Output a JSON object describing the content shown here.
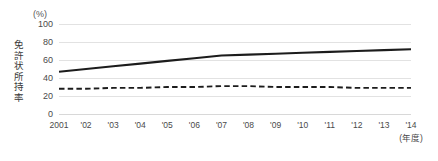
{
  "axis": {
    "unit_label": "(%)",
    "y_title": "免許状所持率",
    "y_title_chars": [
      "免",
      "許",
      "状",
      "所",
      "持",
      "率"
    ],
    "x_unit": "(年度)"
  },
  "chart_data": {
    "type": "line",
    "title": "",
    "xlabel": "(年度)",
    "ylabel": "免許状所持率",
    "yunit": "(%)",
    "ylim": [
      0,
      100
    ],
    "yticks": [
      0,
      20,
      40,
      60,
      80,
      100
    ],
    "ytick_labels": [
      "0",
      "20",
      "40",
      "60",
      "80",
      "100"
    ],
    "grid": true,
    "legend": "none",
    "categories": [
      2001,
      2002,
      2003,
      2004,
      2005,
      2006,
      2007,
      2008,
      2009,
      2010,
      2011,
      2012,
      2013,
      2014
    ],
    "xtick_labels": [
      "2001",
      "'02",
      "'03",
      "'04",
      "'05",
      "'06",
      "'07",
      "'08",
      "'09",
      "'10",
      "'11",
      "'12",
      "'13",
      "'14"
    ],
    "series": [
      {
        "name": "solid-series",
        "style": "solid",
        "color": "#1c1c1c",
        "values": [
          47,
          50,
          53,
          56,
          59,
          62,
          65,
          66,
          67,
          68,
          69,
          70,
          71,
          72
        ]
      },
      {
        "name": "dashed-series",
        "style": "dashed",
        "color": "#1c1c1c",
        "values": [
          28,
          28,
          29,
          29,
          30,
          30,
          31,
          31,
          30,
          30,
          30,
          29,
          29,
          29
        ]
      }
    ]
  }
}
